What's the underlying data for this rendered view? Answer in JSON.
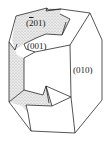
{
  "figure": {
    "type": "crystal morphology drawing",
    "faces": [
      {
        "id": "face-201",
        "label_prefix": "(",
        "label_bar_digit": "2",
        "label_rest": "01)",
        "miller": "(-201)",
        "shaded": true
      },
      {
        "id": "face-001",
        "label": "(001)",
        "miller": "(001)",
        "shaded": false
      },
      {
        "id": "face-010",
        "label": "(010)",
        "miller": "(010)",
        "shaded": false
      }
    ],
    "colors": {
      "line": "#2a2a2a",
      "shade": "#c8c8c8",
      "background": "#ffffff"
    }
  }
}
